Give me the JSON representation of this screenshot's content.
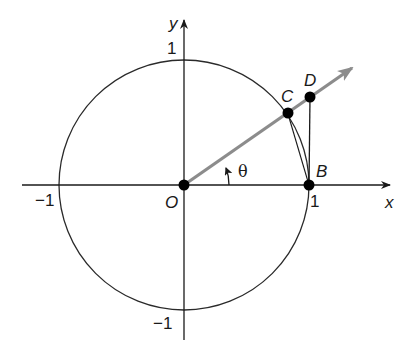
{
  "diagram": {
    "type": "unit-circle-geometry",
    "colors": {
      "axis": "#1a1a1a",
      "circle": "#2a2a2a",
      "ray": "#8c8c8c",
      "point": "#000000",
      "background": "#ffffff"
    },
    "axes": {
      "x_label": "x",
      "y_label": "y"
    },
    "ticks": {
      "x_neg": "−1",
      "x_pos": "1",
      "y_pos": "1",
      "y_neg": "−1"
    },
    "angle_label": "θ",
    "points": [
      {
        "name": "O",
        "label": "O"
      },
      {
        "name": "B",
        "label": "B"
      },
      {
        "name": "C",
        "label": "C"
      },
      {
        "name": "D",
        "label": "D"
      }
    ]
  }
}
